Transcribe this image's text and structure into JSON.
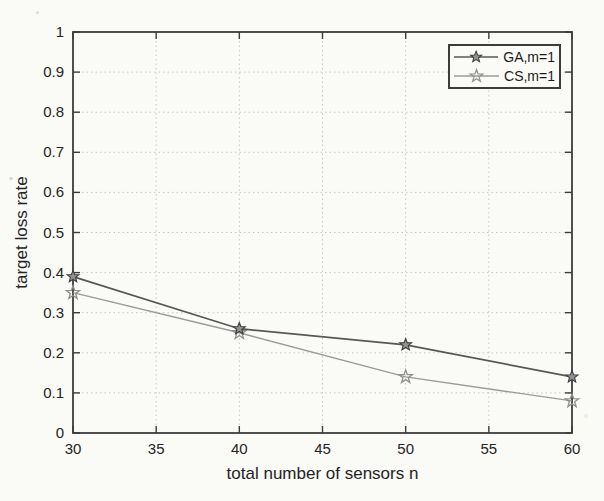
{
  "figure": {
    "background": "#fafaf7",
    "axis_color": "#3c3c3c",
    "grid_color": "#c8c8c4",
    "text_color": "#242424"
  },
  "chart_data": {
    "type": "line",
    "title": "",
    "xlabel": "total number of sensors n",
    "ylabel": "target loss rate",
    "x": [
      30,
      40,
      50,
      60
    ],
    "xlim": [
      30,
      60
    ],
    "ylim": [
      0,
      1
    ],
    "xticks": [
      30,
      35,
      40,
      45,
      50,
      55,
      60
    ],
    "xtick_labels": [
      "30",
      "35",
      "40",
      "45",
      "50",
      "55",
      "60"
    ],
    "yticks": [
      0,
      0.1,
      0.2,
      0.3,
      0.4,
      0.5,
      0.6,
      0.7,
      0.8,
      0.9,
      1
    ],
    "ytick_labels": [
      "0",
      "0.1",
      "0.2",
      "0.3",
      "0.4",
      "0.5",
      "0.6",
      "0.7",
      "0.8",
      "0.9",
      "1"
    ],
    "grid": "dotted",
    "legend": {
      "position": "top-right",
      "border_color": "#3c3c3c"
    },
    "series": [
      {
        "name": "GA,m=1",
        "marker": "pentagram",
        "color": "#575757",
        "marker_fill": "#909090",
        "marker_stroke": "#3f3f3f",
        "values": [
          0.39,
          0.26,
          0.22,
          0.14
        ]
      },
      {
        "name": "CS,m=1",
        "marker": "star",
        "color": "#9a9a9a",
        "marker_fill": "none",
        "marker_stroke": "#8f8f8f",
        "values": [
          0.35,
          0.25,
          0.14,
          0.08
        ]
      }
    ]
  }
}
